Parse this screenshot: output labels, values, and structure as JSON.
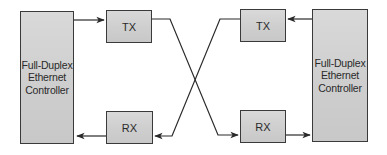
{
  "diagram": {
    "type": "full-duplex ethernet crossover",
    "left_controller": {
      "lines": [
        "Full-Duplex",
        "Ethernet",
        "Controller"
      ]
    },
    "right_controller": {
      "lines": [
        "Full-Duplex",
        "Ethernet",
        "Controller"
      ]
    },
    "left_tx": {
      "label": "TX"
    },
    "left_rx": {
      "label": "RX"
    },
    "right_tx": {
      "label": "TX"
    },
    "right_rx": {
      "label": "RX"
    },
    "connections": [
      {
        "from": "left_controller",
        "to": "left_tx",
        "direction": "right"
      },
      {
        "from": "left_rx",
        "to": "left_controller",
        "direction": "left"
      },
      {
        "from": "right_controller",
        "to": "right_tx",
        "direction": "left"
      },
      {
        "from": "right_rx",
        "to": "right_controller",
        "direction": "right"
      },
      {
        "from": "left_tx",
        "to": "right_rx",
        "crossing": true
      },
      {
        "from": "right_tx",
        "to": "left_rx",
        "crossing": true
      }
    ],
    "colors": {
      "box_fill": "#d0d0d0",
      "box_border": "#3a3a3a",
      "line": "#2a2a2a",
      "text": "#2a2a2a"
    }
  }
}
